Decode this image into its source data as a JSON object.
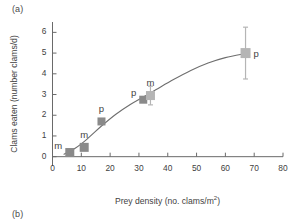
{
  "panel": {
    "label_a": "(a)",
    "label_b": "(b)"
  },
  "chart_data": {
    "type": "scatter",
    "title": "",
    "xlabel": "Prey density (no. clams/m2)",
    "xlabel_base": "Prey density (no. clams/m",
    "xlabel_sup": "2",
    "xlabel_tail": ")",
    "ylabel": "Clams eaten (number clams/d)",
    "xlim": [
      0,
      80
    ],
    "ylim": [
      -0.45,
      6.5
    ],
    "xticks": [
      0,
      10,
      20,
      30,
      40,
      50,
      60,
      70,
      80
    ],
    "xtick_labels": [
      "0",
      "10",
      "20",
      "30",
      "40",
      "50",
      "60",
      "70",
      "80"
    ],
    "yticks": [
      0,
      1,
      2,
      3,
      4,
      5,
      6
    ],
    "ytick_labels": [
      "0",
      "1",
      "2",
      "3",
      "4",
      "5",
      "6"
    ],
    "grid": false,
    "legend": "none",
    "marker": "square",
    "points": [
      {
        "x": 6.0,
        "y": 0.2,
        "label": "m",
        "label_pos": "left",
        "color": "#8a8a8a",
        "err": 0.0,
        "size": 9
      },
      {
        "x": 11.0,
        "y": 0.45,
        "label": "m",
        "label_pos": "top",
        "color": "#8a8a8a",
        "err": 0.0,
        "size": 9
      },
      {
        "x": 17.0,
        "y": 1.7,
        "label": "p",
        "label_pos": "top",
        "color": "#8a8a8a",
        "err": 0.0,
        "size": 8
      },
      {
        "x": 31.5,
        "y": 2.75,
        "label": "p",
        "label_pos": "left",
        "color": "#8a8a8a",
        "err": 0.0,
        "size": 8
      },
      {
        "x": 34.0,
        "y": 2.95,
        "label": "m",
        "label_pos": "top",
        "color": "#b5b5b5",
        "err": 0.45,
        "size": 9
      },
      {
        "x": 67.0,
        "y": 5.0,
        "label": "p",
        "label_pos": "right",
        "color": "#b5b5b5",
        "err": 1.25,
        "size": 10
      }
    ],
    "curve": [
      {
        "x": 4.0,
        "y": 0.12
      },
      {
        "x": 8.0,
        "y": 0.42
      },
      {
        "x": 12.0,
        "y": 0.85
      },
      {
        "x": 17.0,
        "y": 1.48
      },
      {
        "x": 22.0,
        "y": 2.05
      },
      {
        "x": 27.0,
        "y": 2.52
      },
      {
        "x": 31.5,
        "y": 2.88
      },
      {
        "x": 36.0,
        "y": 3.24
      },
      {
        "x": 42.0,
        "y": 3.72
      },
      {
        "x": 48.0,
        "y": 4.16
      },
      {
        "x": 54.0,
        "y": 4.52
      },
      {
        "x": 60.0,
        "y": 4.78
      },
      {
        "x": 67.0,
        "y": 4.98
      }
    ],
    "colors": {
      "marker_dark": "#8a8a8a",
      "marker_light": "#b5b5b5",
      "curve": "#6e6e6e",
      "axis": "#6a6a6a",
      "text": "#3f3f3f"
    }
  }
}
